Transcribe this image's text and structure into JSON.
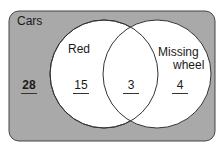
{
  "diagram": {
    "type": "venn",
    "universe_label": "Cars",
    "sets": [
      {
        "name": "Red",
        "label": "Red"
      },
      {
        "name": "Missing wheel",
        "label_line1": "Missing",
        "label_line2": "wheel"
      }
    ],
    "regions": {
      "outside": "28",
      "red_only": "15",
      "both": "3",
      "missing_wheel_only": "4"
    },
    "colors": {
      "background": "#a9a9a9",
      "circle_fill": "#ffffff",
      "stroke": "#333333"
    }
  }
}
